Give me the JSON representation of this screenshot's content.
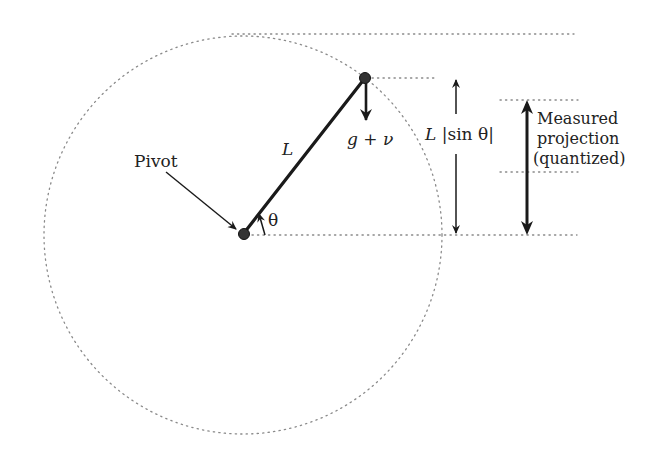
{
  "diagram": {
    "colors": {
      "ink": "#1a1a1a",
      "dots": "#8a8a8a",
      "bob": "#333333"
    },
    "labels": {
      "pivot": "Pivot",
      "length": "L",
      "force": "g + ν",
      "angle": "θ",
      "true_projection": "L |sin θ|",
      "measured_line1": "Measured",
      "measured_line2": "projection",
      "measured_line3": "(quantized)"
    },
    "geometry": {
      "pivot": [
        244,
        234
      ],
      "bob": [
        365,
        78
      ],
      "circle_radius": 199
    }
  }
}
